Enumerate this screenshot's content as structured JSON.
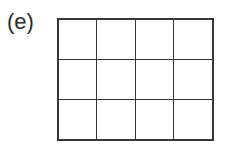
{
  "figure": {
    "label": "(e)",
    "colors": {
      "gray_fill": "#a9a9a9",
      "white_fill": "#ffffff",
      "border": "#373737",
      "label_color": "#2b2b2b",
      "background": "#ffffff"
    }
  },
  "chart_data": {
    "type": "heatmap",
    "title": "(e)",
    "subtitle": "",
    "xlabel": "",
    "ylabel": "",
    "rows": 3,
    "columns": 4,
    "grid": true,
    "legend_position": "none",
    "x": [
      "1",
      "2",
      "3",
      "4"
    ],
    "categories": [
      "row 1",
      "row 2",
      "row 3"
    ],
    "tick_labels": {
      "x": [],
      "y": []
    },
    "value_map": {
      "0": "white",
      "1": "gray"
    },
    "values": [
      [
        1,
        1,
        0,
        1
      ],
      [
        0,
        1,
        1,
        0
      ],
      [
        1,
        0,
        1,
        1
      ]
    ],
    "cells": [
      {
        "row": 0,
        "col": 0,
        "fill": "gray"
      },
      {
        "row": 0,
        "col": 1,
        "fill": "gray"
      },
      {
        "row": 0,
        "col": 2,
        "fill": "white"
      },
      {
        "row": 0,
        "col": 3,
        "fill": "gray"
      },
      {
        "row": 1,
        "col": 0,
        "fill": "white"
      },
      {
        "row": 1,
        "col": 1,
        "fill": "gray"
      },
      {
        "row": 1,
        "col": 2,
        "fill": "gray"
      },
      {
        "row": 1,
        "col": 3,
        "fill": "white"
      },
      {
        "row": 2,
        "col": 0,
        "fill": "gray"
      },
      {
        "row": 2,
        "col": 1,
        "fill": "white"
      },
      {
        "row": 2,
        "col": 2,
        "fill": "gray"
      },
      {
        "row": 2,
        "col": 3,
        "fill": "gray"
      }
    ],
    "counts": {
      "gray": 8,
      "white": 4,
      "total": 12
    },
    "annotations": []
  }
}
